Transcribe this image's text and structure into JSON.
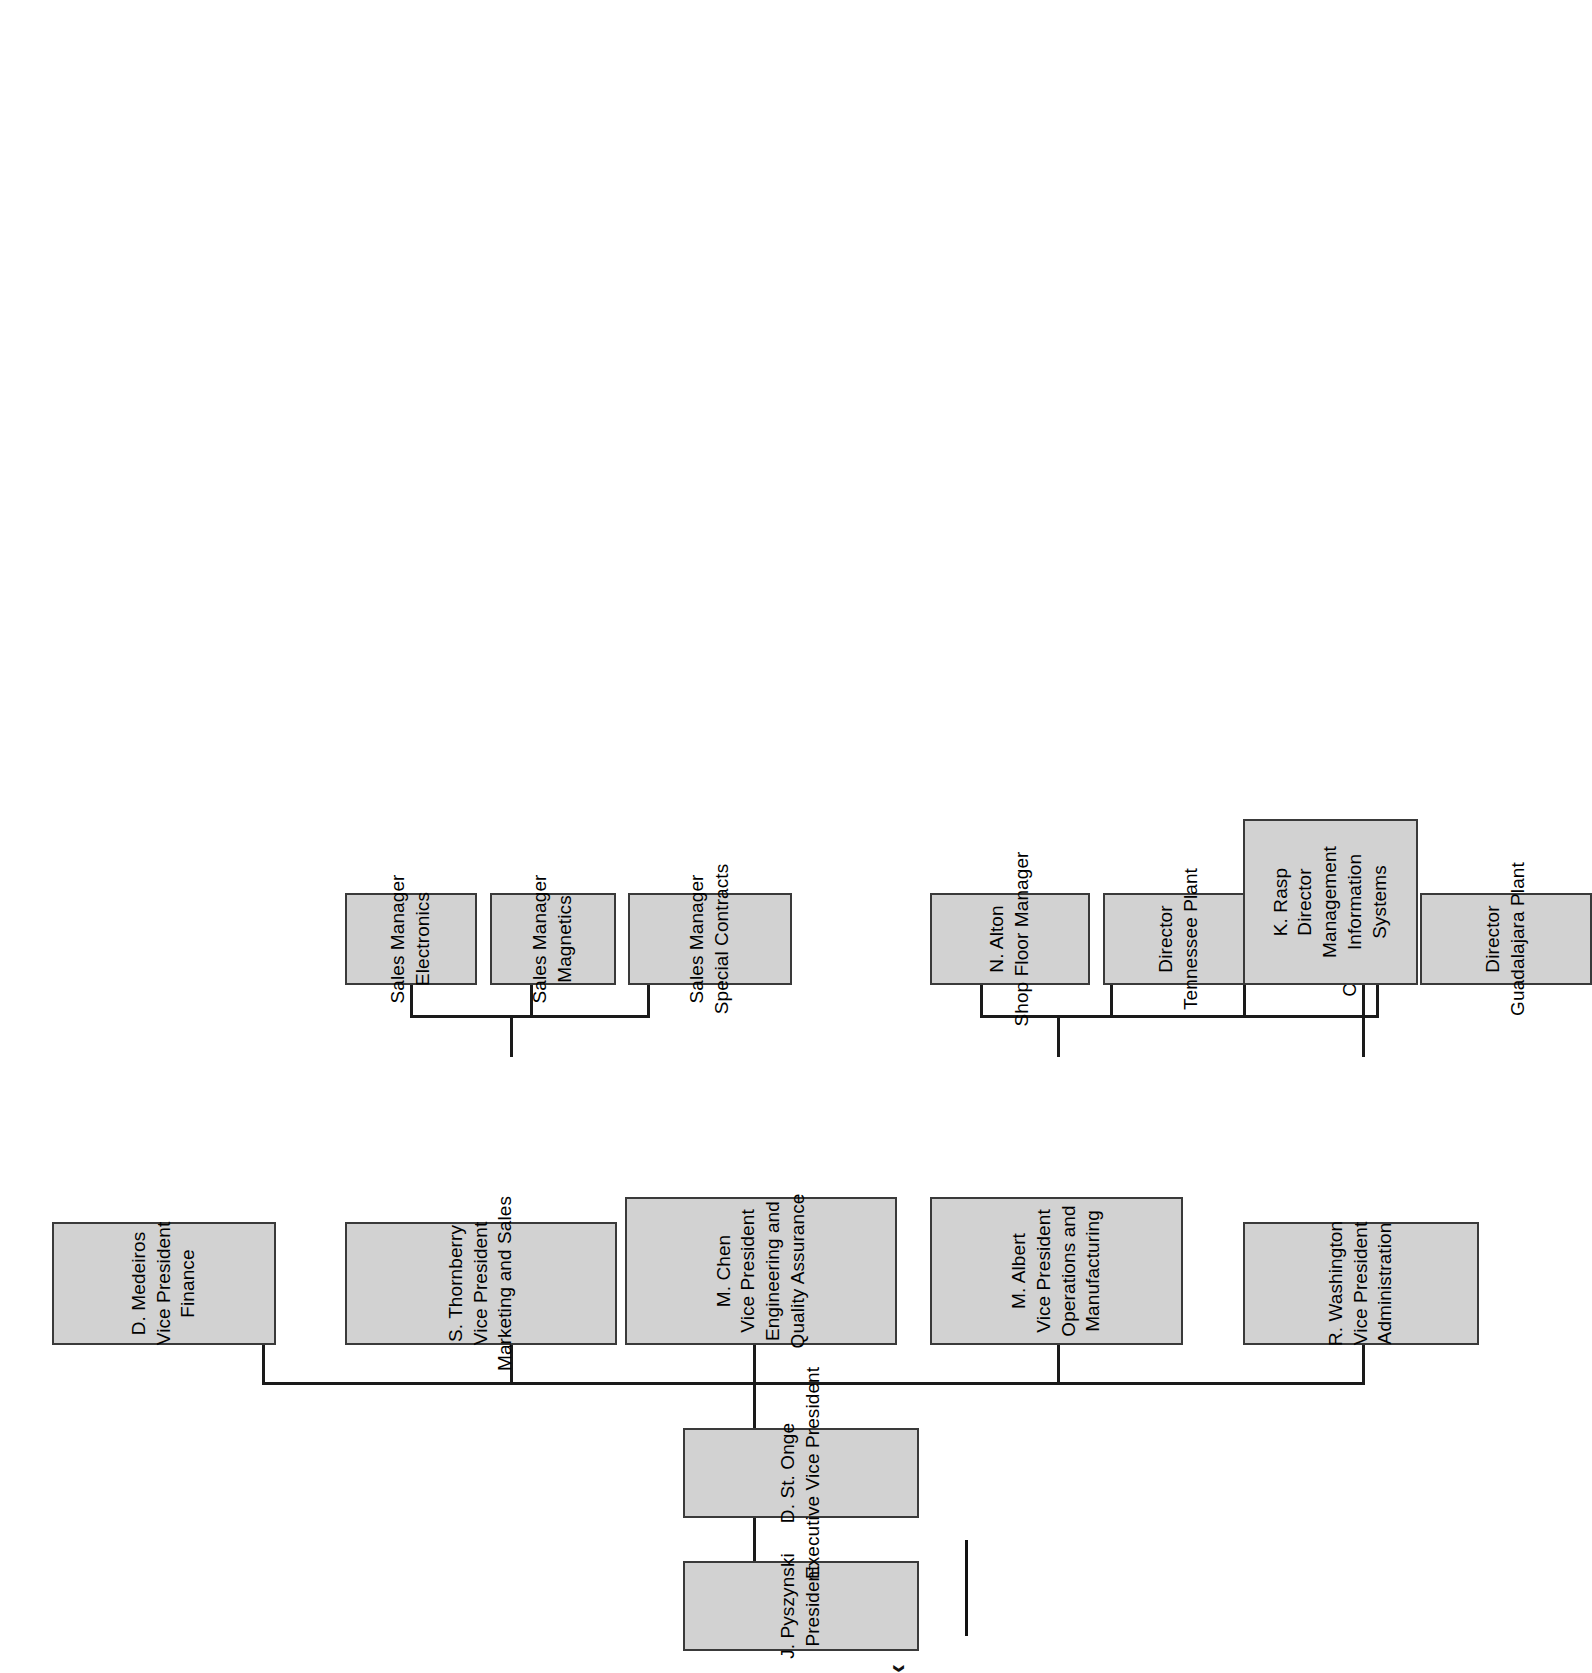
{
  "document": {
    "type": "organization-chart",
    "orientation": "rotated-90-counterclockwise",
    "page_width": 1006,
    "page_height": 1673,
    "background_color": "#ffffff"
  },
  "style": {
    "box_fill": "#d2d2d2",
    "box_border": "#3a3a3a",
    "connector_color": "#1a1a1a",
    "text_color": "#000000"
  },
  "nodes": {
    "president": {
      "lines": [
        "J. Pyszynski",
        "President"
      ]
    },
    "evp": {
      "lines": [
        "D. St. Onge",
        "Executive Vice President"
      ]
    },
    "vp_finance": {
      "lines": [
        "D. Medeiros",
        "Vice President",
        "Finance"
      ]
    },
    "vp_marketing": {
      "lines": [
        "S. Thornberry",
        "Vice President",
        "Marketing and Sales"
      ]
    },
    "vp_engineering": {
      "lines": [
        "M. Chen",
        "Vice President",
        "Engineering and",
        "Quality Assurance"
      ]
    },
    "vp_operations": {
      "lines": [
        "M. Albert",
        "Vice President",
        "Operations and",
        "Manufacturing"
      ]
    },
    "vp_admin": {
      "lines": [
        "R. Washington",
        "Vice President",
        "Administration"
      ]
    },
    "sm_electronics": {
      "lines": [
        "Sales Manager",
        "Electronics"
      ]
    },
    "sm_magnetics": {
      "lines": [
        "Sales Manager",
        "Magnetics"
      ]
    },
    "sm_special": {
      "lines": [
        "Sales Manager",
        "Special  Contracts"
      ]
    },
    "shop_floor": {
      "lines": [
        "N. Alton",
        "Shop Floor Manager"
      ]
    },
    "dir_tennessee": {
      "lines": [
        "Director",
        "Tennessee Plant"
      ]
    },
    "dir_calgary": {
      "lines": [
        "Director",
        "Calgary Plant"
      ]
    },
    "dir_guadalajara": {
      "lines": [
        "Director",
        "Guadalajara Plant"
      ]
    },
    "dir_mis": {
      "lines": [
        "K. Rasp",
        "Director",
        "Management",
        "Information",
        "Systems"
      ]
    }
  },
  "footer": {
    "caption": "‹"
  }
}
